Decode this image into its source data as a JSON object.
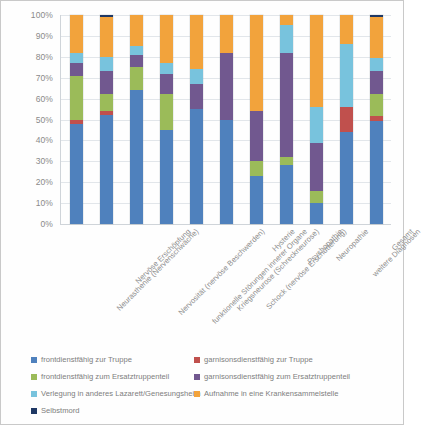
{
  "chart_data": {
    "type": "bar",
    "stacked": true,
    "normalized": true,
    "title": "",
    "subtitle": "",
    "xlabel": "",
    "ylabel": "",
    "ylim": [
      0,
      100
    ],
    "ytick_labels": [
      "0%",
      "10%",
      "20%",
      "30%",
      "40%",
      "50%",
      "60%",
      "70%",
      "80%",
      "90%",
      "100%"
    ],
    "ytick_values": [
      0,
      10,
      20,
      30,
      40,
      50,
      60,
      70,
      80,
      90,
      100
    ],
    "grid": true,
    "legend_position": "bottom",
    "categories": [
      "Neurasthenie (Nervenschwäche)",
      "Nervöse Erschöpfung",
      "Nervosität (nervöse Beschwerden)",
      "funktionelle Störungen innerer Organe",
      "Kriegsneurose (Schreckneurose)",
      "Schock (nervöse Erschütterung)",
      "Hysterie",
      "Psychopathie",
      "Neuropathie",
      "weitere Diagnosen",
      "Gesamt"
    ],
    "series": [
      {
        "name": "frontdienstfähig zur Truppe",
        "color": "#4f81bd",
        "values": [
          48,
          52,
          64,
          45,
          55,
          50,
          23,
          28,
          10,
          44,
          50
        ]
      },
      {
        "name": "garnisonsdienstfähig zur Truppe",
        "color": "#c0504d",
        "values": [
          2,
          2,
          0,
          0,
          0,
          0,
          0,
          0,
          0,
          12,
          2
        ]
      },
      {
        "name": "frontdienstfähig zum Ersatztruppenteil",
        "color": "#9bbb59",
        "values": [
          21,
          8,
          11,
          17,
          0,
          0,
          7,
          4,
          6,
          0,
          11
        ]
      },
      {
        "name": "garnisonsdienstfähig zum Ersatztruppenteil",
        "color": "#71588f",
        "values": [
          6,
          11,
          6,
          10,
          12,
          32,
          24,
          50,
          23,
          0,
          11
        ]
      },
      {
        "name": "Verlegung in anderes Lazarett/Genesungsheim",
        "color": "#78c3dd",
        "values": [
          5,
          7,
          4,
          5,
          7,
          0,
          0,
          13,
          17,
          30,
          6
        ]
      },
      {
        "name": "Aufnahme in eine Krankensammelstelle",
        "color": "#f2a33c",
        "values": [
          18,
          19,
          15,
          23,
          26,
          18,
          46,
          5,
          44,
          14,
          20
        ]
      },
      {
        "name": "Selbstmord",
        "color": "#1f3864",
        "values": [
          0,
          1,
          0,
          0,
          0,
          0,
          0,
          0,
          0,
          0,
          1
        ]
      }
    ]
  }
}
